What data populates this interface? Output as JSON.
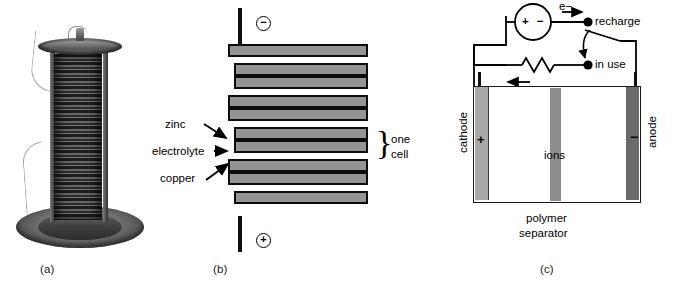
{
  "figure": {
    "kind": "three-panel battery figure",
    "captions": [
      {
        "key": "a",
        "text": "(a)"
      },
      {
        "key": "b",
        "text": "(b)"
      },
      {
        "key": "c",
        "text": "(c)"
      }
    ]
  },
  "panel_a": {
    "caption": "(a)",
    "subject": "voltaic-pile-photograph"
  },
  "panel_b": {
    "caption": "(b)",
    "labels": {
      "zinc": "zinc",
      "electrolyte": "electrolyte",
      "copper": "copper",
      "one_cell_line1": "one",
      "one_cell_line2": "cell"
    },
    "terminals": {
      "top": "−",
      "bottom": "+"
    },
    "plates": [
      {
        "type": "long"
      },
      {
        "type": "short"
      },
      {
        "type": "long"
      },
      {
        "type": "short"
      },
      {
        "type": "long"
      },
      {
        "type": "short"
      },
      {
        "type": "long"
      },
      {
        "type": "short"
      },
      {
        "type": "long"
      }
    ]
  },
  "panel_c": {
    "caption": "(c)",
    "labels": {
      "cathode": "cathode",
      "anode": "anode",
      "ions": "ions",
      "polymer_line1": "polymer",
      "polymer_line2": "separator",
      "recharge": "recharge",
      "in_use": "in use",
      "load": "load",
      "electron_top": "e−",
      "electron_left": "e−",
      "source_plus": "+",
      "source_minus": "−",
      "cathode_sign": "+",
      "anode_sign": "−"
    }
  },
  "colors": {
    "plate_fill": "#949494",
    "plate_border": "#0d0d0d",
    "cathode": "#a8a8a8",
    "anode": "#6a6a6a",
    "separator": "#8d8d8d",
    "ink": "#000000",
    "background": "#ffffff"
  }
}
